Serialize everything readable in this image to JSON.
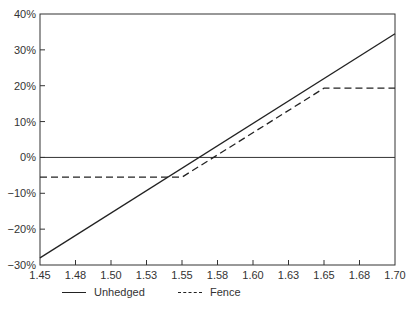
{
  "chart_data": {
    "type": "line",
    "title": "",
    "xlabel": "",
    "ylabel": "",
    "x": [
      1.45,
      1.48,
      1.5,
      1.53,
      1.55,
      1.58,
      1.6,
      1.63,
      1.65,
      1.68,
      1.7
    ],
    "x_tick_labels": [
      "1.45",
      "1.48",
      "1.50",
      "1.53",
      "1.55",
      "1.58",
      "1.60",
      "1.63",
      "1.65",
      "1.68",
      "1.70"
    ],
    "y_tick_labels": [
      "40%",
      "30%",
      "20%",
      "10%",
      "0%",
      "−10%",
      "−20%",
      "−30%"
    ],
    "ylim": [
      -30,
      40
    ],
    "xlim": [
      1.45,
      1.7
    ],
    "grid": false,
    "legend_position": "bottom",
    "series": [
      {
        "name": "Unhedged",
        "style": "solid",
        "points": [
          [
            1.45,
            -28
          ],
          [
            1.7,
            34.5
          ]
        ]
      },
      {
        "name": "Fence",
        "style": "dashed",
        "points": [
          [
            1.45,
            -5.5
          ],
          [
            1.55,
            -5.5
          ],
          [
            1.65,
            19.3
          ],
          [
            1.7,
            19.3
          ]
        ]
      }
    ],
    "reference_line": {
      "y": 0
    }
  },
  "legend": {
    "unhedged": "Unhedged",
    "fence": "Fence"
  }
}
